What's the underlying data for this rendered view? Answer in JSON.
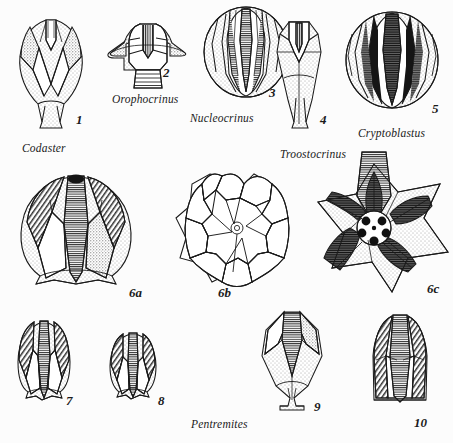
{
  "figure": {
    "background_color": "#fcfcfc",
    "ink_color": "#1a1a1a",
    "width": 453,
    "height": 443
  },
  "genus_labels": [
    {
      "name": "codaster-label",
      "text": "Codaster",
      "x": 22,
      "y": 142
    },
    {
      "name": "orophocrinus-label",
      "text": "Orophocrinus",
      "x": 112,
      "y": 93
    },
    {
      "name": "nucleocrinus-label",
      "text": "Nucleocrinus",
      "x": 190,
      "y": 112
    },
    {
      "name": "troostocrinus-label",
      "text": "Troostocrinus",
      "x": 280,
      "y": 148
    },
    {
      "name": "cryptoblastus-label",
      "text": "Cryptoblastus",
      "x": 358,
      "y": 127
    },
    {
      "name": "pentremites-label",
      "text": "Pentremites",
      "x": 191,
      "y": 418
    }
  ],
  "specimen_numbers": [
    {
      "name": "number-1",
      "text": "1",
      "x": 76,
      "y": 112
    },
    {
      "name": "number-2",
      "text": "2",
      "x": 163,
      "y": 65
    },
    {
      "name": "number-3",
      "text": "3",
      "x": 269,
      "y": 85
    },
    {
      "name": "number-4",
      "text": "4",
      "x": 320,
      "y": 112
    },
    {
      "name": "number-5",
      "text": "5",
      "x": 432,
      "y": 101
    },
    {
      "name": "number-6a",
      "text": "6a",
      "x": 129,
      "y": 285
    },
    {
      "name": "number-6b",
      "text": "6b",
      "x": 218,
      "y": 285
    },
    {
      "name": "number-6c",
      "text": "6c",
      "x": 427,
      "y": 281
    },
    {
      "name": "number-7",
      "text": "7",
      "x": 66,
      "y": 393
    },
    {
      "name": "number-8",
      "text": "8",
      "x": 158,
      "y": 393
    },
    {
      "name": "number-9",
      "text": "9",
      "x": 314,
      "y": 399
    },
    {
      "name": "number-10",
      "text": "10",
      "x": 414,
      "y": 415
    }
  ],
  "specimens": [
    {
      "name": "specimen-codaster-1",
      "number": "1",
      "genus": "Codaster",
      "view": "side view, elongate pyriform theca with deep V-notched summit"
    },
    {
      "name": "specimen-orophocrinus-2",
      "number": "2",
      "genus": "Orophocrinus",
      "view": "side view, broad flaring theca with ringed columnal stem"
    },
    {
      "name": "specimen-nucleocrinus-3",
      "number": "3",
      "genus": "Nucleocrinus",
      "view": "side view, ovoid theca with long ribbed ambulacra"
    },
    {
      "name": "specimen-troostocrinus-4",
      "number": "4",
      "genus": "Troostocrinus",
      "view": "side view, slender elongate spindle-shaped theca"
    },
    {
      "name": "specimen-cryptoblastus-5",
      "number": "5",
      "genus": "Cryptoblastus",
      "view": "side view, globular theca, heavily inked ambulacra"
    },
    {
      "name": "specimen-pentremites-6a",
      "number": "6a",
      "genus": "Pentremites",
      "view": "side view, broad rounded theca"
    },
    {
      "name": "specimen-pentremites-6b",
      "number": "6b",
      "genus": "Pentremites",
      "view": "oral plate diagram, pentaradial outline"
    },
    {
      "name": "specimen-pentremites-6c",
      "number": "6c",
      "genus": "Pentremites",
      "view": "oral view, star-shaped with five spiracles"
    },
    {
      "name": "specimen-pentremites-7",
      "number": "7",
      "genus": "Pentremites",
      "view": "side view, rounded bud form"
    },
    {
      "name": "specimen-pentremites-8",
      "number": "8",
      "genus": "Pentremites",
      "view": "side view, short squat bud form"
    },
    {
      "name": "specimen-pentremites-9",
      "number": "9",
      "genus": "Pentremites",
      "view": "side view, elongate angular theca with basal stem facet"
    },
    {
      "name": "specimen-pentremites-10",
      "number": "10",
      "genus": "Pentremites",
      "view": "side view, tall dome-topped theca"
    }
  ]
}
